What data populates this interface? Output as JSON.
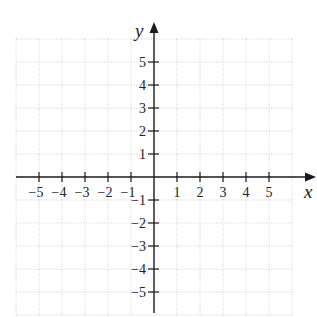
{
  "diagram": {
    "type": "cartesian-coordinate-plane",
    "x_axis": {
      "label": "x",
      "tick_labels": [
        "−5",
        "−4",
        "−3",
        "−2",
        "−1",
        "1",
        "2",
        "3",
        "4",
        "5"
      ],
      "tick_values": [
        -5,
        -4,
        -3,
        -2,
        -1,
        1,
        2,
        3,
        4,
        5
      ],
      "grid_range": [
        -6,
        6
      ],
      "arrow": "positive-end"
    },
    "y_axis": {
      "label": "y",
      "tick_labels": [
        "5",
        "4",
        "3",
        "2",
        "1",
        "−1",
        "−2",
        "−3",
        "−4",
        "−5"
      ],
      "tick_values": [
        5,
        4,
        3,
        2,
        1,
        -1,
        -2,
        -3,
        -4,
        -5
      ],
      "grid_range": [
        -6,
        6
      ],
      "arrow": "positive-end"
    },
    "grid": {
      "style": "dotted",
      "color": "#c4c4c4",
      "spacing": 1
    },
    "axis_color": "#1a1a1a"
  }
}
